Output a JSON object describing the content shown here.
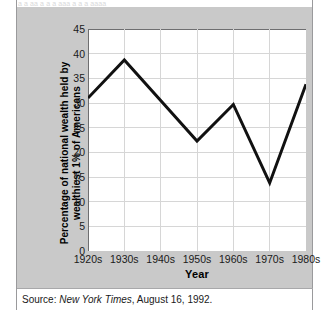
{
  "figure": {
    "top_clipped_text": "a a aa a a a aaa a a a aaaa",
    "source_prefix": "Source:",
    "source_publication": "New York Times",
    "source_rest": ", August 16, 1992.",
    "colors": {
      "panel_background": "#c9c9c9",
      "plot_background": "#ffffff",
      "gridline": "#d6d6d6",
      "axis_line": "#6e6e70",
      "line_series": "#111111",
      "text": "#1a1a1a",
      "card_rule": "#9a9a9c"
    }
  },
  "chart_data": {
    "type": "line",
    "title": "",
    "subtitle": "",
    "xlabel": "Year",
    "ylabel": "Percentage of national wealth held by wealthiest 1% of Americans",
    "categories": [
      "1920s",
      "1930s",
      "1940s",
      "1950s",
      "1960s",
      "1970s",
      "1980s"
    ],
    "values": [
      31.0,
      38.7,
      30.5,
      22.3,
      29.7,
      13.8,
      33.8
    ],
    "series": [
      {
        "name": "Percentage of national wealth held by wealthiest 1% of Americans",
        "values": [
          31.0,
          38.7,
          30.5,
          22.3,
          29.7,
          13.8,
          33.8
        ]
      }
    ],
    "ylim": [
      0,
      45
    ],
    "ytick_step": 5,
    "yticks": [
      45,
      40,
      35,
      30,
      25,
      20,
      15,
      10,
      5,
      0
    ],
    "ytick_labels": [
      "45",
      "40",
      "35",
      "30",
      "25",
      "20",
      "15",
      "10",
      "5",
      "0"
    ],
    "grid": true,
    "grid_axes": "both",
    "legend": false,
    "legend_position": "none",
    "markers": false,
    "line_width_px": 3
  }
}
